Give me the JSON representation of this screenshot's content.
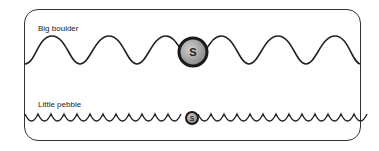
{
  "diagram": {
    "panels": [
      {
        "id": "big",
        "label": "Big boulder",
        "object_letter": "S"
      },
      {
        "id": "little",
        "label": "Little pebble",
        "object_letter": "S"
      }
    ],
    "colors": {
      "line": "#222222",
      "object_fill": "#a0a0a0",
      "object_edge": "#1a1a1a",
      "frame": "#333333"
    }
  }
}
